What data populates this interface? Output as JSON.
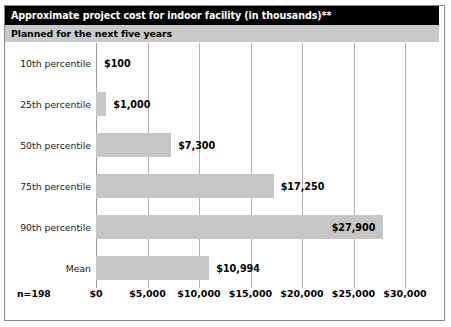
{
  "header": {
    "title": "Approximate project cost for indoor facility (in thousands)**",
    "subtitle": "Planned for the next five years"
  },
  "footnote": {
    "sample_size": "n=198"
  },
  "chart_data": {
    "type": "bar",
    "orientation": "horizontal",
    "title": "Approximate project cost for indoor facility (in thousands)**",
    "subtitle": "Planned for the next five years",
    "xlabel": "",
    "ylabel": "",
    "xlim": [
      0,
      30000
    ],
    "grid": true,
    "legend": "none",
    "categories": [
      "10th percentile",
      "25th percentile",
      "50th percentile",
      "75th percentile",
      "90th percentile",
      "Mean"
    ],
    "values": [
      100,
      1000,
      7300,
      17250,
      27900,
      10994
    ],
    "value_labels": [
      "$100",
      "$1,000",
      "$7,300",
      "$17,250",
      "$27,900",
      "$10,994"
    ],
    "label_placement": [
      "outside",
      "outside",
      "outside",
      "outside",
      "inside",
      "outside"
    ],
    "tick_values": [
      0,
      5000,
      10000,
      15000,
      20000,
      25000,
      30000
    ],
    "tick_labels": [
      "$0",
      "$5,000",
      "$10,000",
      "$15,000",
      "$20,000",
      "$25,000",
      "$30,000"
    ],
    "bar_color": "#c6c6c6",
    "grid_color": "#b4b4b4",
    "title_bg": "#000000",
    "title_fg": "#ffffff",
    "subtitle_bg": "#c9c9c9",
    "subtitle_fg": "#000000",
    "sample_size": "n=198"
  }
}
